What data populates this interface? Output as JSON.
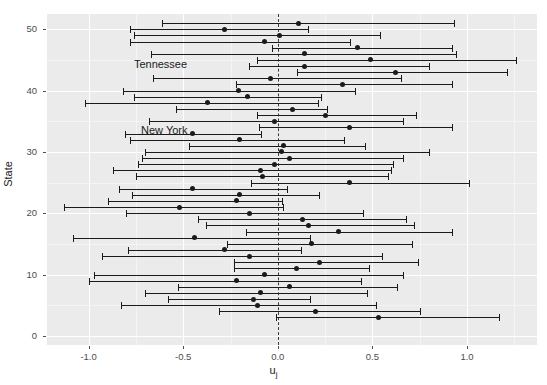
{
  "chart_data": {
    "type": "scatter",
    "subtype": "caterpillar-plot-with-error-bars",
    "title": "",
    "xlabel": "u_j",
    "xlabel_base": "u",
    "xlabel_sub": "j",
    "ylabel": "State",
    "xlim": [
      -1.22,
      1.37
    ],
    "ylim": [
      -1.5,
      52.5
    ],
    "xticks": [
      -1.0,
      -0.5,
      0.0,
      0.5,
      1.0
    ],
    "xticklabels": [
      "-1.0",
      "-0.5",
      "0.0",
      "0.5",
      "1.0"
    ],
    "yticks": [
      0,
      10,
      20,
      30,
      40,
      50
    ],
    "yticklabels": [
      "0",
      "10",
      "20",
      "30",
      "40",
      "50"
    ],
    "grid": true,
    "legend": false,
    "reference_line": {
      "x": 0.0,
      "style": "dashed"
    },
    "panel_background": "#ebebeb",
    "grid_color": "#ffffff",
    "point_color": "#1a1a1a",
    "annotations": [
      {
        "text": "Tennessee",
        "x": -0.62,
        "y": 44.0
      },
      {
        "text": "New York",
        "x": -0.6,
        "y": 33.3
      }
    ],
    "series_name": "State random effects",
    "points": [
      {
        "y": 51,
        "est": 0.11,
        "lo": -0.61,
        "hi": 0.93
      },
      {
        "y": 50,
        "est": -0.28,
        "lo": -0.78,
        "hi": 0.16
      },
      {
        "y": 49,
        "est": 0.01,
        "lo": -0.76,
        "hi": 0.54
      },
      {
        "y": 48,
        "est": -0.07,
        "lo": -0.78,
        "hi": 0.38
      },
      {
        "y": 47,
        "est": 0.42,
        "lo": -0.03,
        "hi": 0.92
      },
      {
        "y": 46,
        "est": 0.14,
        "lo": -0.67,
        "hi": 0.94
      },
      {
        "y": 45,
        "est": 0.49,
        "lo": -0.11,
        "hi": 1.26
      },
      {
        "y": 44,
        "est": 0.14,
        "lo": -0.15,
        "hi": 0.8
      },
      {
        "y": 43,
        "est": 0.62,
        "lo": 0.1,
        "hi": 1.21
      },
      {
        "y": 42,
        "est": -0.04,
        "lo": -0.66,
        "hi": 0.65
      },
      {
        "y": 41,
        "est": 0.34,
        "lo": -0.22,
        "hi": 0.92
      },
      {
        "y": 40,
        "est": -0.21,
        "lo": -0.82,
        "hi": 0.41
      },
      {
        "y": 39,
        "est": -0.16,
        "lo": -0.76,
        "hi": 0.23
      },
      {
        "y": 38,
        "est": -0.37,
        "lo": -1.02,
        "hi": 0.21
      },
      {
        "y": 37,
        "est": 0.08,
        "lo": -0.54,
        "hi": 0.26
      },
      {
        "y": 36,
        "est": 0.25,
        "lo": -0.11,
        "hi": 0.73
      },
      {
        "y": 35,
        "est": -0.02,
        "lo": -0.68,
        "hi": 0.66
      },
      {
        "y": 34,
        "est": 0.38,
        "lo": -0.1,
        "hi": 0.92
      },
      {
        "y": 33,
        "est": -0.45,
        "lo": -0.81,
        "hi": -0.09
      },
      {
        "y": 32,
        "est": -0.2,
        "lo": -0.78,
        "hi": 0.35
      },
      {
        "y": 31,
        "est": 0.03,
        "lo": -0.47,
        "hi": 0.46
      },
      {
        "y": 30,
        "est": 0.02,
        "lo": -0.7,
        "hi": 0.8
      },
      {
        "y": 29,
        "est": 0.06,
        "lo": -0.72,
        "hi": 0.66
      },
      {
        "y": 28,
        "est": -0.02,
        "lo": -0.74,
        "hi": 0.61
      },
      {
        "y": 27,
        "est": -0.09,
        "lo": -0.87,
        "hi": 0.6
      },
      {
        "y": 26,
        "est": -0.08,
        "lo": -0.75,
        "hi": 0.58
      },
      {
        "y": 25,
        "est": 0.38,
        "lo": -0.14,
        "hi": 1.01
      },
      {
        "y": 24,
        "est": -0.45,
        "lo": -0.84,
        "hi": 0.05
      },
      {
        "y": 23,
        "est": -0.2,
        "lo": -0.77,
        "hi": 0.22
      },
      {
        "y": 22,
        "est": -0.22,
        "lo": -0.9,
        "hi": 0.02
      },
      {
        "y": 21,
        "est": -0.52,
        "lo": -1.13,
        "hi": 0.03
      },
      {
        "y": 20,
        "est": -0.15,
        "lo": -0.8,
        "hi": 0.45
      },
      {
        "y": 19,
        "est": 0.13,
        "lo": -0.42,
        "hi": 0.68
      },
      {
        "y": 18,
        "est": 0.16,
        "lo": -0.38,
        "hi": 0.72
      },
      {
        "y": 17,
        "est": 0.32,
        "lo": -0.17,
        "hi": 0.92
      },
      {
        "y": 16,
        "est": -0.44,
        "lo": -1.08,
        "hi": 0.17
      },
      {
        "y": 15,
        "est": 0.18,
        "lo": -0.27,
        "hi": 0.71
      },
      {
        "y": 14,
        "est": -0.28,
        "lo": -0.79,
        "hi": 0.12
      },
      {
        "y": 13,
        "est": -0.15,
        "lo": -0.93,
        "hi": 0.55
      },
      {
        "y": 12,
        "est": 0.22,
        "lo": -0.23,
        "hi": 0.74
      },
      {
        "y": 11,
        "est": 0.1,
        "lo": -0.23,
        "hi": 0.48
      },
      {
        "y": 10,
        "est": -0.07,
        "lo": -0.97,
        "hi": 0.66
      },
      {
        "y": 9,
        "est": -0.22,
        "lo": -1.0,
        "hi": 0.44
      },
      {
        "y": 8,
        "est": 0.06,
        "lo": -0.53,
        "hi": 0.63
      },
      {
        "y": 7,
        "est": -0.09,
        "lo": -0.7,
        "hi": 0.47
      },
      {
        "y": 6,
        "est": -0.13,
        "lo": -0.58,
        "hi": 0.17
      },
      {
        "y": 5,
        "est": -0.11,
        "lo": -0.83,
        "hi": 0.52
      },
      {
        "y": 4,
        "est": 0.2,
        "lo": -0.31,
        "hi": 0.75
      },
      {
        "y": 3,
        "est": 0.53,
        "lo": -0.01,
        "hi": 1.17
      }
    ]
  }
}
